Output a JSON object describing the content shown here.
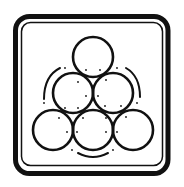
{
  "symbol": {
    "name": "stacked-round-objects-pictogram",
    "colors": {
      "ink": "#111111",
      "background": "#ffffff"
    },
    "frame": {
      "outer": {
        "x": 15.5,
        "y": 16.5,
        "w": 152.5,
        "h": 157,
        "rx": 14,
        "stroke_width": 5
      },
      "inner": {
        "x": 21.5,
        "y": 22.5,
        "w": 141,
        "h": 143,
        "rx": 9,
        "stroke_width": 1.5
      }
    },
    "circles": [
      {
        "cx": 93,
        "cy": 57,
        "r": 20
      },
      {
        "cx": 73,
        "cy": 93,
        "r": 20
      },
      {
        "cx": 113,
        "cy": 93,
        "r": 20
      },
      {
        "cx": 53,
        "cy": 130,
        "r": 20
      },
      {
        "cx": 93,
        "cy": 130,
        "r": 20
      },
      {
        "cx": 133,
        "cy": 130,
        "r": 20
      }
    ],
    "arcs": [
      {
        "d": "M 44 99 Q 44 76 60 68"
      },
      {
        "d": "M 126 68 Q 140 76 140 97"
      },
      {
        "d": "M 78 153 Q 93 161 108 153"
      }
    ],
    "dots": [
      [
        65,
        68
      ],
      [
        86,
        70
      ],
      [
        100,
        70
      ],
      [
        117,
        68
      ],
      [
        78,
        82
      ],
      [
        106,
        80
      ],
      [
        86,
        96
      ],
      [
        98,
        96
      ],
      [
        44,
        103
      ],
      [
        65,
        108
      ],
      [
        78,
        108
      ],
      [
        105,
        106
      ],
      [
        121,
        106
      ],
      [
        137,
        103
      ],
      [
        59,
        118
      ],
      [
        83,
        118
      ],
      [
        106,
        118
      ],
      [
        126,
        117
      ],
      [
        67,
        132
      ],
      [
        77,
        132
      ],
      [
        106,
        132
      ],
      [
        117,
        132
      ],
      [
        72,
        150
      ],
      [
        113,
        150
      ]
    ]
  }
}
